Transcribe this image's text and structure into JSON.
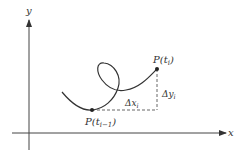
{
  "diagram": {
    "axes": {
      "x_label": "x",
      "y_label": "y"
    },
    "points": {
      "start": {
        "label_base": "P(t",
        "label_sub": "i−1",
        "label_end": ")"
      },
      "end": {
        "label_base": "P(t",
        "label_sub": "i",
        "label_end": ")"
      }
    },
    "increments": {
      "dx": {
        "base": "Δx",
        "sub": "i"
      },
      "dy": {
        "base": "Δy",
        "sub": "i"
      }
    },
    "colors": {
      "stroke": "#333333",
      "background": "#ffffff"
    }
  }
}
